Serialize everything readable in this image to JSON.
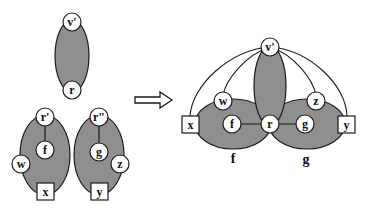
{
  "colors": {
    "region_fill": "#8f8f8f",
    "stroke": "#1a1a1a",
    "node_fill": "#ffffff",
    "background": "#ffffff"
  },
  "left": {
    "top_component": {
      "top_node": "v'",
      "bottom_node": "r"
    },
    "component_f": {
      "root": "r'",
      "center": "f",
      "side": "w",
      "terminal": "x"
    },
    "component_g": {
      "root": "r\"",
      "center": "g",
      "side": "z",
      "terminal": "y"
    }
  },
  "arrow": {
    "direction": "right",
    "meaning": "transforms-to"
  },
  "right": {
    "apex": "v'",
    "hub": "r",
    "nodes": {
      "w": "w",
      "z": "z",
      "f": "f",
      "g": "g",
      "x": "x",
      "y": "y"
    },
    "captions": {
      "f": "f",
      "g": "g"
    }
  }
}
